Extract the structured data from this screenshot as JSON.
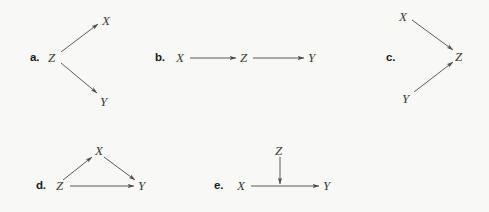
{
  "figure": {
    "background_color": "#f8f8f6",
    "line_color": "#4a4a4a",
    "label_color": "#3a3a3a",
    "panel_letter_color": "#1a1a1a"
  },
  "panels": [
    {
      "letter": "a.",
      "letter_x": 30,
      "letter_y": 51,
      "nodes": [
        {
          "name": "Z",
          "label": "Z",
          "x": 48,
          "y": 50
        },
        {
          "name": "X",
          "label": "X",
          "x": 102,
          "y": 13
        },
        {
          "name": "Y",
          "label": "Y",
          "x": 100,
          "y": 94
        }
      ],
      "edges": [
        {
          "from": "Z",
          "to": "X",
          "x1": 61,
          "y1": 52,
          "x2": 98,
          "y2": 24
        },
        {
          "from": "Z",
          "to": "Y",
          "x1": 61,
          "y1": 63,
          "x2": 97,
          "y2": 93
        }
      ]
    },
    {
      "letter": "b.",
      "letter_x": 155,
      "letter_y": 51,
      "nodes": [
        {
          "name": "X",
          "label": "X",
          "x": 176,
          "y": 50
        },
        {
          "name": "Z",
          "label": "Z",
          "x": 240,
          "y": 50
        },
        {
          "name": "Y",
          "label": "Y",
          "x": 308,
          "y": 50
        }
      ],
      "edges": [
        {
          "from": "X",
          "to": "Z",
          "x1": 190,
          "y1": 58,
          "x2": 236,
          "y2": 58
        },
        {
          "from": "Z",
          "to": "Y",
          "x1": 253,
          "y1": 58,
          "x2": 304,
          "y2": 58
        }
      ]
    },
    {
      "letter": "c.",
      "letter_x": 386,
      "letter_y": 51,
      "nodes": [
        {
          "name": "X",
          "label": "X",
          "x": 399,
          "y": 9
        },
        {
          "name": "Z",
          "label": "Z",
          "x": 455,
          "y": 49
        },
        {
          "name": "Y",
          "label": "Y",
          "x": 402,
          "y": 91
        }
      ],
      "edges": [
        {
          "from": "X",
          "to": "Z",
          "x1": 412,
          "y1": 20,
          "x2": 453,
          "y2": 50
        },
        {
          "from": "Y",
          "to": "Z",
          "x1": 414,
          "y1": 92,
          "x2": 453,
          "y2": 62
        }
      ]
    },
    {
      "letter": "d.",
      "letter_x": 36,
      "letter_y": 179,
      "nodes": [
        {
          "name": "Z",
          "label": "Z",
          "x": 56,
          "y": 178
        },
        {
          "name": "X",
          "label": "X",
          "x": 95,
          "y": 143
        },
        {
          "name": "Y",
          "label": "Y",
          "x": 138,
          "y": 178
        }
      ],
      "edges": [
        {
          "from": "Z",
          "to": "X",
          "x1": 63,
          "y1": 180,
          "x2": 92,
          "y2": 157
        },
        {
          "from": "X",
          "to": "Y",
          "x1": 104,
          "y1": 157,
          "x2": 135,
          "y2": 180
        },
        {
          "from": "Z",
          "to": "Y",
          "x1": 70,
          "y1": 186,
          "x2": 134,
          "y2": 186
        }
      ]
    },
    {
      "letter": "e.",
      "letter_x": 214,
      "letter_y": 179,
      "nodes": [
        {
          "name": "X",
          "label": "X",
          "x": 237,
          "y": 178
        },
        {
          "name": "Z",
          "label": "Z",
          "x": 275,
          "y": 143
        },
        {
          "name": "Y",
          "label": "Y",
          "x": 323,
          "y": 178
        }
      ],
      "edges": [
        {
          "from": "X",
          "to": "Y",
          "x1": 251,
          "y1": 186,
          "x2": 319,
          "y2": 186
        },
        {
          "from": "Z",
          "to": "XY-edge",
          "x1": 280,
          "y1": 157,
          "x2": 280,
          "y2": 184
        }
      ]
    }
  ]
}
